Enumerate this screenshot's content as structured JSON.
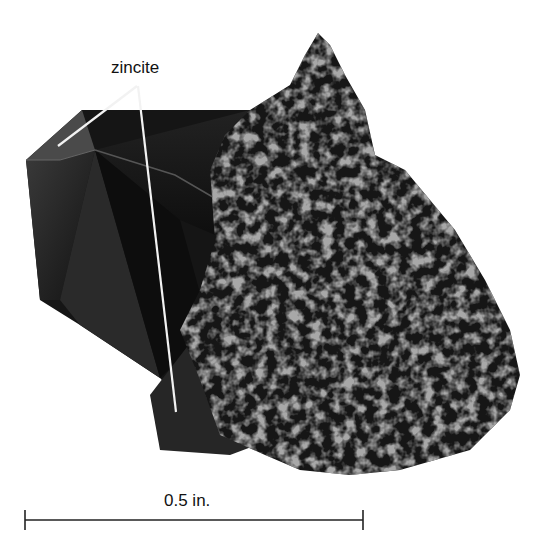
{
  "figure": {
    "labels": {
      "mineral": "zincite",
      "scale": "0.5 in."
    },
    "colors": {
      "background": "#ffffff",
      "crystal": "#1a1a1a",
      "rock_dark": "#141414",
      "rock_light": "#9a9a9a",
      "pointer_line": "#f2f2f2",
      "text": "#111111"
    }
  }
}
